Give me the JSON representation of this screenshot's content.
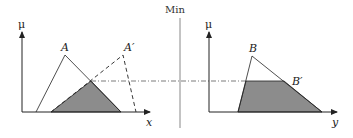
{
  "title": "Min",
  "left_panel": {
    "y_axis_label": "μ",
    "x_axis_label": "x",
    "set_a_label": "A",
    "set_a_prime_label": "A′"
  },
  "right_panel": {
    "y_axis_label": "μ",
    "x_axis_label": "y",
    "set_b_label": "B",
    "set_b_prime_label": "B′"
  },
  "colors": {
    "fill": "#8c8c8c",
    "line": "#222222",
    "divider": "#888888"
  }
}
